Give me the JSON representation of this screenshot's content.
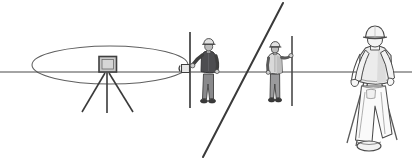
{
  "figure": {
    "title": "Surveying scene line diagram",
    "canvas": {
      "width": 412,
      "height": 164
    },
    "background_color": "#ffffff"
  },
  "palette": {
    "line": "#3a3a3a",
    "line_soft": "#5f5f5f",
    "outline": "#4a4a4a",
    "jacket_dark": "#4d4d50",
    "jacket_light": "#d9d9d9",
    "jacket_mid": "#c3c3c3",
    "trousers_dark": "#8a8a8c",
    "trousers_mid": "#9a9a9c",
    "hat_light": "#e2e2e2",
    "hat_mid": "#bdbdbd",
    "instrument_fill": "#c9c9c9",
    "instrument_frame": "#4a4a4a",
    "skin": "#cfcfcf",
    "boot_dark": "#3f3f3f",
    "white": "#ffffff"
  },
  "elements": {
    "sight_line": {
      "name": "horizontal level sight line",
      "x1": 0,
      "y1": 72,
      "x2": 412,
      "y2": 72,
      "stroke_width": 1.2
    },
    "sweep_ellipse": {
      "name": "horizontal sweep plane of the total station",
      "cx": 110,
      "cy": 65,
      "rx": 78,
      "ry": 19,
      "stroke_width": 1.1
    },
    "diagonal_line": {
      "name": "inclined sight line",
      "x1": 283,
      "y1": 3,
      "x2": 203,
      "y2": 157,
      "stroke_width": 2.0
    },
    "total_station": {
      "name": "total station instrument on tripod",
      "head": {
        "x": 99,
        "y": 57,
        "width": 17,
        "height": 15
      },
      "tripod_apex": {
        "x": 107,
        "y": 72
      },
      "legs": [
        {
          "x2": 82,
          "y2": 112
        },
        {
          "x2": 107,
          "y2": 113
        },
        {
          "x2": 133,
          "y2": 112
        }
      ]
    },
    "rod_left": {
      "name": "prism rod held by near surveyor",
      "x": 190,
      "y_top": 32,
      "y_bottom": 108,
      "prism": {
        "x": 181,
        "y": 64,
        "width": 9,
        "height": 8
      }
    },
    "rod_right": {
      "name": "prism rod held by far surveyor",
      "x": 292,
      "y_top": 36,
      "y_bottom": 106
    }
  },
  "figures": [
    {
      "id": "surveyor-near",
      "name": "surveyor holding prism rod, dark jacket",
      "facing": "front",
      "hard_hat_color": "#e2e2e2",
      "jacket_color": "#4d4d50",
      "trousers_color": "#8a8a8c",
      "anchor_x": 211,
      "ground_y": 106,
      "height_px": 62,
      "holds": "rod_left"
    },
    {
      "id": "surveyor-far",
      "name": "surveyor holding prism rod, light jacket",
      "facing": "front",
      "hard_hat_color": "#e2e2e2",
      "jacket_color": "#d9d9d9",
      "trousers_color": "#9a9a9c",
      "anchor_x": 277,
      "ground_y": 104,
      "height_px": 58,
      "holds": "rod_right"
    },
    {
      "id": "surveyor-carrying-tripod",
      "name": "surveyor seen from behind carrying tripod",
      "facing": "back",
      "hard_hat_color": "#f2f2f2",
      "jacket_color": "#ececec",
      "trousers_color": "#f6f6f6",
      "anchor_x": 376,
      "ground_y": 148,
      "height_px": 118,
      "holds": "tripod-over-shoulder"
    }
  ]
}
